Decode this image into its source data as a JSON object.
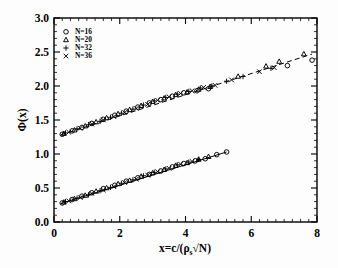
{
  "figure": {
    "background_color": "#ffffff",
    "foreground_color": "#000000"
  },
  "axes": {
    "x": {
      "title": "x=c/(ρ",
      "title_sub": "s",
      "title_tail": "√N)",
      "title_full": "x=c/(ρs√N)",
      "min": 0,
      "max": 8,
      "ticklabels": [
        "0",
        "2",
        "4",
        "6",
        "8"
      ],
      "tickvalues": [
        0,
        2,
        4,
        6,
        8
      ],
      "minor_step": 0.25
    },
    "y": {
      "title": "Φ(x)",
      "min": 0.0,
      "max": 3.0,
      "ticklabels": [
        "0.0",
        "0.5",
        "1.0",
        "1.5",
        "2.0",
        "2.5",
        "3.0"
      ],
      "tickvalues": [
        0.0,
        0.5,
        1.0,
        1.5,
        2.0,
        2.5,
        3.0
      ],
      "minor_step": 0.1
    }
  },
  "legend": {
    "position": "top-left-inside",
    "entries": [
      {
        "marker": "circle-marker",
        "label": "N=16"
      },
      {
        "marker": "triangle-marker",
        "label": "N=20"
      },
      {
        "marker": "plus-marker",
        "label": "N=32"
      },
      {
        "marker": "cross-marker",
        "label": "N=36"
      }
    ]
  },
  "chart_data": {
    "type": "scatter",
    "title": "",
    "xlabel": "x=c/(ρs√N)",
    "ylabel": "Φ(x)",
    "xlim": [
      0,
      8
    ],
    "ylim": [
      0,
      3
    ],
    "grid": false,
    "legend_position": "upper left",
    "branches": [
      {
        "name": "upper-branch",
        "fit_line_style": "dashed",
        "fit_endpoints": [
          [
            0.2,
            1.28
          ],
          [
            7.85,
            2.47
          ]
        ],
        "series": [
          {
            "name": "N=16",
            "marker": "circle",
            "x": [
              0.25,
              0.55,
              0.85,
              1.15,
              1.5,
              1.85,
              2.2,
              2.55,
              2.9,
              3.25,
              3.6,
              3.95,
              4.35,
              4.7,
              7.1,
              7.85
            ],
            "y": [
              1.29,
              1.34,
              1.39,
              1.45,
              1.51,
              1.57,
              1.63,
              1.69,
              1.75,
              1.8,
              1.85,
              1.9,
              1.93,
              1.96,
              2.3,
              2.38
            ]
          },
          {
            "name": "N=20",
            "marker": "triangle",
            "x": [
              0.3,
              0.62,
              0.95,
              1.28,
              1.6,
              1.95,
              2.3,
              2.65,
              3.0,
              3.35,
              3.7,
              4.05,
              4.4,
              4.75,
              5.6,
              6.45,
              6.85,
              7.6
            ],
            "y": [
              1.3,
              1.35,
              1.41,
              1.47,
              1.53,
              1.59,
              1.65,
              1.71,
              1.77,
              1.82,
              1.87,
              1.91,
              1.95,
              1.99,
              2.14,
              2.29,
              2.36,
              2.47
            ]
          },
          {
            "name": "N=32",
            "marker": "plus",
            "x": [
              0.35,
              0.7,
              1.05,
              1.4,
              1.72,
              2.05,
              2.4,
              2.72,
              3.05,
              3.4,
              3.75,
              4.1,
              4.45,
              4.8,
              5.25,
              5.75,
              6.6
            ],
            "y": [
              1.31,
              1.37,
              1.43,
              1.48,
              1.54,
              1.6,
              1.66,
              1.72,
              1.78,
              1.83,
              1.88,
              1.92,
              1.97,
              2.0,
              2.07,
              2.14,
              2.26
            ]
          },
          {
            "name": "N=36",
            "marker": "cross",
            "x": [
              0.45,
              0.8,
              1.15,
              1.5,
              1.82,
              2.15,
              2.5,
              2.85,
              3.15,
              3.5,
              3.85,
              4.2,
              4.55,
              4.9,
              5.4,
              6.25,
              6.7
            ],
            "y": [
              1.32,
              1.38,
              1.44,
              1.5,
              1.55,
              1.61,
              1.67,
              1.73,
              1.79,
              1.84,
              1.89,
              1.93,
              1.98,
              2.01,
              2.09,
              2.21,
              2.27
            ]
          }
        ]
      },
      {
        "name": "lower-branch",
        "fit_line_style": "solid",
        "fit_endpoints": [
          [
            0.2,
            0.27
          ],
          [
            5.25,
            1.03
          ]
        ],
        "series": [
          {
            "name": "N=16",
            "marker": "circle",
            "x": [
              0.25,
              0.55,
              0.85,
              1.15,
              1.5,
              1.85,
              2.2,
              2.55,
              2.9,
              3.25,
              3.6,
              3.95,
              4.3,
              4.6,
              4.95,
              5.25
            ],
            "y": [
              0.28,
              0.33,
              0.38,
              0.43,
              0.49,
              0.54,
              0.6,
              0.65,
              0.7,
              0.75,
              0.81,
              0.86,
              0.9,
              0.93,
              0.99,
              1.03
            ]
          },
          {
            "name": "N=20",
            "marker": "triangle",
            "x": [
              0.3,
              0.62,
              0.95,
              1.28,
              1.6,
              1.95,
              2.3,
              2.65,
              3.0,
              3.35,
              3.7,
              4.05,
              4.4,
              4.7
            ],
            "y": [
              0.29,
              0.34,
              0.39,
              0.45,
              0.5,
              0.56,
              0.61,
              0.67,
              0.72,
              0.77,
              0.83,
              0.87,
              0.92,
              0.96
            ]
          },
          {
            "name": "N=32",
            "marker": "plus",
            "x": [
              0.35,
              0.7,
              1.05,
              1.4,
              1.72,
              2.05,
              2.4,
              2.72,
              3.05,
              3.4,
              3.75,
              4.1,
              4.4
            ],
            "y": [
              0.3,
              0.35,
              0.4,
              0.46,
              0.51,
              0.57,
              0.62,
              0.68,
              0.73,
              0.78,
              0.84,
              0.88,
              0.92
            ]
          },
          {
            "name": "N=36",
            "marker": "cross",
            "x": [
              0.45,
              0.8,
              1.15,
              1.5,
              1.82,
              2.15,
              2.5,
              2.85,
              3.15,
              3.5,
              3.85,
              4.2
            ],
            "y": [
              0.31,
              0.36,
              0.42,
              0.47,
              0.52,
              0.58,
              0.63,
              0.69,
              0.74,
              0.79,
              0.85,
              0.89
            ]
          }
        ]
      }
    ]
  }
}
